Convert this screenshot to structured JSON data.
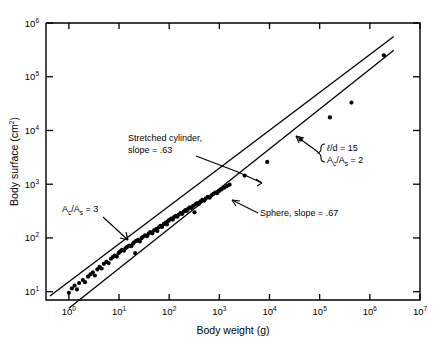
{
  "chart_data": {
    "type": "scatter",
    "title": "",
    "xlabel": "Body weight (g)",
    "ylabel": "Body surface (cm2)",
    "ylabel_base": "Body surface (cm",
    "ylabel_sup": "2",
    "ylabel_tail": ")",
    "xscale": "log",
    "yscale": "log",
    "xlim": [
      0.35,
      10000000
    ],
    "ylim": [
      7,
      1000000
    ],
    "grid": false,
    "legend": "none",
    "xticks": [
      {
        "value": 1,
        "mantissa": "10",
        "exp": "0"
      },
      {
        "value": 10,
        "mantissa": "10",
        "exp": "1"
      },
      {
        "value": 100,
        "mantissa": "10",
        "exp": "2"
      },
      {
        "value": 1000,
        "mantissa": "10",
        "exp": "3"
      },
      {
        "value": 10000,
        "mantissa": "10",
        "exp": "4"
      },
      {
        "value": 100000,
        "mantissa": "10",
        "exp": "5"
      },
      {
        "value": 1000000,
        "mantissa": "10",
        "exp": "6"
      },
      {
        "value": 10000000,
        "mantissa": "10",
        "exp": "7"
      }
    ],
    "yticks": [
      {
        "value": 10,
        "mantissa": "10",
        "exp": "1"
      },
      {
        "value": 100,
        "mantissa": "10",
        "exp": "2"
      },
      {
        "value": 1000,
        "mantissa": "10",
        "exp": "3"
      },
      {
        "value": 10000,
        "mantissa": "10",
        "exp": "4"
      },
      {
        "value": 100000,
        "mantissa": "10",
        "exp": "5"
      },
      {
        "value": 1000000,
        "mantissa": "10",
        "exp": "6"
      }
    ],
    "series": [
      {
        "name": "Body surface measurements",
        "marker": "filled-circle",
        "color": "#000000",
        "points": [
          [
            1.0,
            9.5
          ],
          [
            1.15,
            11.5
          ],
          [
            1.3,
            13.0
          ],
          [
            1.45,
            11.0
          ],
          [
            1.6,
            14.5
          ],
          [
            1.9,
            16.5
          ],
          [
            2.1,
            15.0
          ],
          [
            2.4,
            19.0
          ],
          [
            2.7,
            21.0
          ],
          [
            3.0,
            23.0
          ],
          [
            3.3,
            20.0
          ],
          [
            3.7,
            26.0
          ],
          [
            4.1,
            29.0
          ],
          [
            4.5,
            27.0
          ],
          [
            5.0,
            33.0
          ],
          [
            5.6,
            36.0
          ],
          [
            6.2,
            34.0
          ],
          [
            6.9,
            41.0
          ],
          [
            7.5,
            44.0
          ],
          [
            8.2,
            47.0
          ],
          [
            9.0,
            45.0
          ],
          [
            9.8,
            52.0
          ],
          [
            10.5,
            56.0
          ],
          [
            11.5,
            60.0
          ],
          [
            12.5,
            58.0
          ],
          [
            13.5,
            64.0
          ],
          [
            14.5,
            68.0
          ],
          [
            16.0,
            72.0
          ],
          [
            17.5,
            70.0
          ],
          [
            19.0,
            78.0
          ],
          [
            20.0,
            83.0
          ],
          [
            21.0,
            52.0
          ],
          [
            22.0,
            88.0
          ],
          [
            24.0,
            92.0
          ],
          [
            26.0,
            86.0
          ],
          [
            28.0,
            99.0
          ],
          [
            30.0,
            105.0
          ],
          [
            33.0,
            112.0
          ],
          [
            36.0,
            108.0
          ],
          [
            39.0,
            120.0
          ],
          [
            42.0,
            128.0
          ],
          [
            46.0,
            122.0
          ],
          [
            50.0,
            138.0
          ],
          [
            55.0,
            146.0
          ],
          [
            58.0,
            135.0
          ],
          [
            62.0,
            158.0
          ],
          [
            67.0,
            168.0
          ],
          [
            72.0,
            160.0
          ],
          [
            78.0,
            180.0
          ],
          [
            85.0,
            192.0
          ],
          [
            90.0,
            178.0
          ],
          [
            95.0,
            205.0
          ],
          [
            100.0,
            215.0
          ],
          [
            110.0,
            230.0
          ],
          [
            118.0,
            220.0
          ],
          [
            125.0,
            245.0
          ],
          [
            135.0,
            258.0
          ],
          [
            145.0,
            248.0
          ],
          [
            155.0,
            272.0
          ],
          [
            168.0,
            290.0
          ],
          [
            180.0,
            280.0
          ],
          [
            195.0,
            310.0
          ],
          [
            210.0,
            330.0
          ],
          [
            225.0,
            318.0
          ],
          [
            240.0,
            350.0
          ],
          [
            260.0,
            372.0
          ],
          [
            280.0,
            360.0
          ],
          [
            300.0,
            395.0
          ],
          [
            320.0,
            300.0
          ],
          [
            330.0,
            420.0
          ],
          [
            360.0,
            445.0
          ],
          [
            390.0,
            430.0
          ],
          [
            420.0,
            480.0
          ],
          [
            460.0,
            510.0
          ],
          [
            500.0,
            495.0
          ],
          [
            540.0,
            545.0
          ],
          [
            590.0,
            580.0
          ],
          [
            640.0,
            560.0
          ],
          [
            700.0,
            620.0
          ],
          [
            760.0,
            660.0
          ],
          [
            830.0,
            700.0
          ],
          [
            900.0,
            680.0
          ],
          [
            980.0,
            750.0
          ],
          [
            1100.0,
            800.0
          ],
          [
            1250.0,
            860.0
          ],
          [
            1400.0,
            920.0
          ],
          [
            1600.0,
            980.0
          ],
          [
            3200.0,
            1450.0
          ],
          [
            9000.0,
            2600.0
          ],
          [
            42000.0,
            6800.0
          ],
          [
            160000.0,
            17500.0
          ],
          [
            430000.0,
            33000.0
          ],
          [
            1900000.0,
            250000.0
          ]
        ]
      }
    ],
    "fit_lines": [
      {
        "name": "Stretched cylinder",
        "slope": 0.63,
        "label": "Stretched cylinder,",
        "label2": "slope = .63",
        "x0": 0.42,
        "y0": 8.3,
        "x1": 3000000.0,
        "y1": 560000.0
      },
      {
        "name": "Sphere",
        "slope": 0.67,
        "label": "Sphere, slope = .67",
        "x0": 1.0,
        "y0": 4.9,
        "x1": 3000000.0,
        "y1": 310000.0
      }
    ],
    "annotations": [
      {
        "id": "stretched-cylinder",
        "lines": [
          "Stretched cylinder,",
          "slope = .63"
        ],
        "x": 128,
        "y": 141
      },
      {
        "id": "ac-as-3",
        "rich": true,
        "parts": [
          "A",
          "c",
          "/A",
          "s",
          " = 3"
        ],
        "text": "Ac/As = 3",
        "x": 62,
        "y": 212
      },
      {
        "id": "sphere-slope",
        "text": "Sphere, slope = .67",
        "x": 260,
        "y": 216
      },
      {
        "id": "ratio-brace",
        "line1_parts": [
          "ℓ/d",
          " = 15"
        ],
        "line1": "l/d = 15",
        "line2_parts": [
          "A",
          "c",
          "/A",
          "s",
          " = 2"
        ],
        "line2": "Ac/As = 2",
        "x": 322,
        "y": 152
      }
    ]
  },
  "figure": {
    "xlabel": "Body weight  (g)",
    "ylabel_full": "Body  surface  (cm2)"
  }
}
